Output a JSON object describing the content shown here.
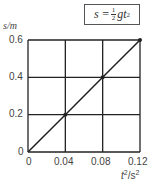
{
  "chart_data": {
    "type": "line",
    "title": "",
    "annotation": "s = ½gt²",
    "formula": {
      "lhs": "s =",
      "frac_num": "1",
      "frac_den": "2",
      "rest": "gt",
      "exp": "2"
    },
    "xlabel": "t²/s²",
    "ylabel": "s/m",
    "xlabel_parts": {
      "var": "t",
      "exp": "2",
      "unit": "/s",
      "unit_exp": "2"
    },
    "x_ticks": [
      "0",
      "0.04",
      "0.08",
      "0.12"
    ],
    "y_ticks": [
      "0",
      "0.2",
      "0.4",
      "0.6"
    ],
    "xlim": [
      0,
      0.12
    ],
    "ylim": [
      0,
      0.6
    ],
    "grid": true,
    "series": [
      {
        "name": "s vs t²",
        "x": [
          0,
          0.04,
          0.08,
          0.12
        ],
        "y": [
          0,
          0.2,
          0.4,
          0.6
        ],
        "markers": [
          [
            0.04,
            0.2
          ],
          [
            0.08,
            0.4
          ],
          [
            0.12,
            0.6
          ]
        ]
      }
    ],
    "colors": {
      "line": "#222222",
      "grid": "#222222",
      "text": "#444444"
    }
  }
}
